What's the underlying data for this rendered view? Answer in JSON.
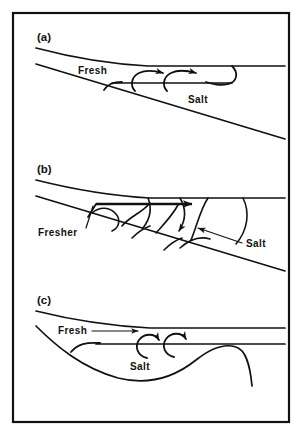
{
  "figure": {
    "caption_panels": [
      "(a)",
      "(b)",
      "(c)"
    ],
    "stroke_color": "#111111",
    "background_color": "#ffffff",
    "frame": {
      "x": 13,
      "y": 13,
      "width": 276,
      "height": 409
    }
  },
  "panels": [
    {
      "id": "a",
      "label": "(a)",
      "label_x": 37,
      "label_y": 41,
      "regime": "salt-wedge with interfacial billows",
      "labels": [
        {
          "name": "fresh",
          "text": "Fresh",
          "x": 78,
          "y": 74
        },
        {
          "name": "salt",
          "text": "Salt",
          "x": 188,
          "y": 103
        }
      ],
      "eddy_count": 2
    },
    {
      "id": "b",
      "label": "(b)",
      "label_x": 37,
      "label_y": 173,
      "regime": "partially mixed with vigorous interfacial mixing",
      "labels": [
        {
          "name": "fresher",
          "text": "Fresher",
          "x": 38,
          "y": 236
        },
        {
          "name": "salt",
          "text": "Salt",
          "x": 246,
          "y": 247
        }
      ],
      "billow_count": 5
    },
    {
      "id": "c",
      "label": "(c)",
      "label_x": 37,
      "label_y": 304,
      "regime": "well mixed over undulating bed",
      "labels": [
        {
          "name": "fresh",
          "text": "Fresh",
          "x": 58,
          "y": 334
        },
        {
          "name": "salt",
          "text": "Salt",
          "x": 130,
          "y": 370
        }
      ],
      "eddy_count": 2
    }
  ]
}
